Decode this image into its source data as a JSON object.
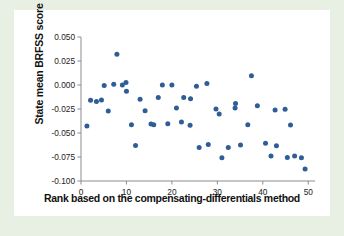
{
  "figure": {
    "background_color": "#e8f0e4",
    "panel_color": "#ffffff",
    "point_color": "#2f5d96",
    "axis_color": "#8d8d8d"
  },
  "chart_data": {
    "type": "scatter",
    "title": "",
    "xlabel": "Rank based on the compensating-differentials method",
    "ylabel": "State mean BRFSS score",
    "xlim": [
      -2,
      52
    ],
    "ylim": [
      -0.1,
      0.05
    ],
    "xticks": [
      0,
      10,
      20,
      30,
      40,
      50
    ],
    "xtick_labels": [
      "0",
      "10",
      "20",
      "30",
      "40",
      "50"
    ],
    "yticks": [
      0.05,
      0.025,
      0.0,
      -0.025,
      -0.05,
      -0.075,
      -0.1
    ],
    "ytick_labels": [
      "0.050",
      "0.025",
      "0.000",
      "-0.025",
      "-0.050",
      "-0.075",
      "-0.100"
    ],
    "grid": false,
    "legend": null,
    "series": [
      {
        "name": "State mean BRFSS score",
        "marker": "circle",
        "color": "#2f5d96",
        "points": [
          [
            1.3,
            -0.0427
          ],
          [
            2.1,
            -0.0158
          ],
          [
            3.4,
            -0.0172
          ],
          [
            4.5,
            -0.0156
          ],
          [
            5.1,
            -0.0006
          ],
          [
            6.0,
            -0.0271
          ],
          [
            7.2,
            0.0007
          ],
          [
            7.9,
            0.032
          ],
          [
            9.1,
            0.0
          ],
          [
            9.9,
            0.0025
          ],
          [
            10.0,
            -0.0065
          ],
          [
            11.1,
            -0.0413
          ],
          [
            12.0,
            -0.0631
          ],
          [
            13.0,
            -0.0149
          ],
          [
            14.1,
            -0.0268
          ],
          [
            15.4,
            -0.0405
          ],
          [
            16.0,
            -0.0413
          ],
          [
            17.0,
            -0.0131
          ],
          [
            17.9,
            0.0
          ],
          [
            19.1,
            -0.0403
          ],
          [
            20.0,
            0.0
          ],
          [
            21.0,
            -0.024
          ],
          [
            22.1,
            -0.0385
          ],
          [
            22.6,
            -0.0131
          ],
          [
            24.0,
            -0.0419
          ],
          [
            24.1,
            -0.0144
          ],
          [
            25.4,
            -0.0013
          ],
          [
            26.0,
            -0.0651
          ],
          [
            27.7,
            0.0016
          ],
          [
            28.0,
            -0.0619
          ],
          [
            29.7,
            -0.025
          ],
          [
            30.4,
            -0.0302
          ],
          [
            31.0,
            -0.0759
          ],
          [
            32.4,
            -0.0651
          ],
          [
            33.9,
            -0.024
          ],
          [
            34.0,
            -0.0194
          ],
          [
            35.1,
            -0.0625
          ],
          [
            36.7,
            -0.0415
          ],
          [
            37.5,
            0.0096
          ],
          [
            38.8,
            -0.0215
          ],
          [
            42.7,
            -0.026
          ],
          [
            44.9,
            -0.0253
          ],
          [
            46.1,
            -0.0417
          ],
          [
            40.6,
            -0.0606
          ],
          [
            43.0,
            -0.0634
          ],
          [
            41.8,
            -0.074
          ],
          [
            45.4,
            -0.0754
          ],
          [
            47.0,
            -0.074
          ],
          [
            48.5,
            -0.0757
          ],
          [
            49.3,
            -0.0875
          ]
        ]
      }
    ]
  }
}
